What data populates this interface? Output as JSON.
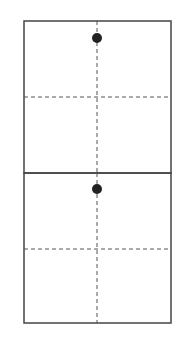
{
  "diagram": {
    "colors": {
      "stroke": "#444444",
      "dash": "#555555",
      "dot": "#222222",
      "background": "#ffffff"
    },
    "panels": [
      {
        "id": "top",
        "box": {
          "x": 24,
          "y": 21,
          "w": 147,
          "h": 152
        },
        "dashed_vertical_x": 97,
        "dashed_horizontal_y": 97,
        "dot": {
          "cx": 97,
          "cy": 38,
          "r": 5
        }
      },
      {
        "id": "bottom",
        "box": {
          "x": 24,
          "y": 173,
          "w": 147,
          "h": 150
        },
        "dashed_vertical_x": 97,
        "dashed_horizontal_y": 249,
        "dot": {
          "cx": 97,
          "cy": 189,
          "r": 5
        }
      }
    ]
  }
}
